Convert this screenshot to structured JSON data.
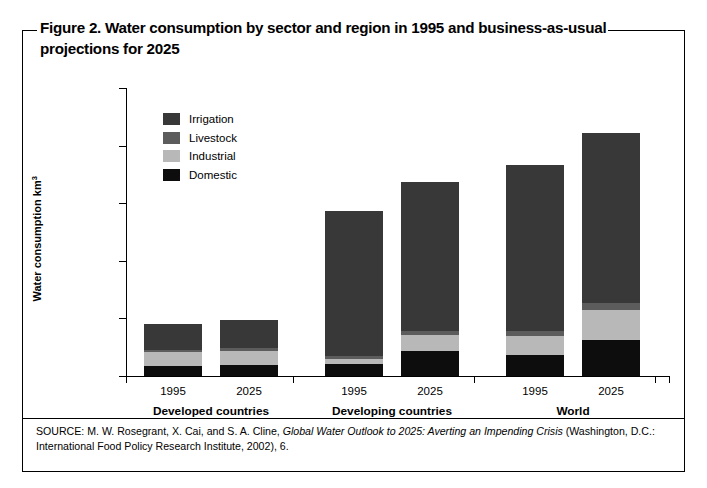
{
  "figure": {
    "title": "Figure 2. Water consumption by sector and region in 1995 and business-as-usual projections for 2025",
    "source_prefix": "SOURCE: M. W. Rosegrant, X. Cai, and S. A. Cline, ",
    "source_italic": "Global Water Outlook to 2025: Averting an Impending Crisis",
    "source_suffix": " (Washington, D.C.: International Food Policy Research Institute, 2002), 6."
  },
  "chart_data": {
    "type": "bar",
    "subtype": "stacked-grouped",
    "title": "Figure 2. Water consumption by sector and region in 1995 and business-as-usual projections for 2025",
    "xlabel": "",
    "ylabel": "Water consumption km³",
    "ylim": [
      0,
      2500
    ],
    "yticks": [
      0,
      500,
      1000,
      1500,
      2000,
      2500
    ],
    "ytick_labels": [
      "0",
      "500",
      "1000",
      "1500",
      "2000",
      "2500"
    ],
    "grid": false,
    "legend_position": "upper-left-inside",
    "groups": [
      {
        "label": "Developed countries",
        "categories": [
          "1995",
          "2025"
        ]
      },
      {
        "label": "Developing countries",
        "categories": [
          "1995",
          "2025"
        ]
      },
      {
        "label": "World",
        "categories": [
          "1995",
          "2025"
        ]
      }
    ],
    "categories": [
      "Developed countries 1995",
      "Developed countries 2025",
      "Developing countries 1995",
      "Developing countries 2025",
      "World 1995",
      "World 2025"
    ],
    "series": [
      {
        "name": "Domestic",
        "color": "#0d0d0d",
        "values": [
          85,
          95,
          105,
          220,
          185,
          310
        ]
      },
      {
        "name": "Industrial",
        "color": "#b8b8b8",
        "values": [
          120,
          125,
          45,
          135,
          165,
          265
        ]
      },
      {
        "name": "Livestock",
        "color": "#5c5c5c",
        "values": [
          20,
          22,
          20,
          35,
          40,
          58
        ]
      },
      {
        "name": "Irrigation",
        "color": "#383838",
        "values": [
          225,
          240,
          1260,
          1290,
          1440,
          1477
        ]
      }
    ],
    "totals": [
      450,
      482,
      1430,
      1680,
      1830,
      2110
    ],
    "stack_order_bottom_to_top": [
      "Domestic",
      "Industrial",
      "Livestock",
      "Irrigation"
    ]
  },
  "legend": {
    "items": [
      {
        "label": "Irrigation",
        "color": "#383838"
      },
      {
        "label": "Livestock",
        "color": "#5c5c5c"
      },
      {
        "label": "Industrial",
        "color": "#b8b8b8"
      },
      {
        "label": "Domestic",
        "color": "#0d0d0d"
      }
    ]
  }
}
